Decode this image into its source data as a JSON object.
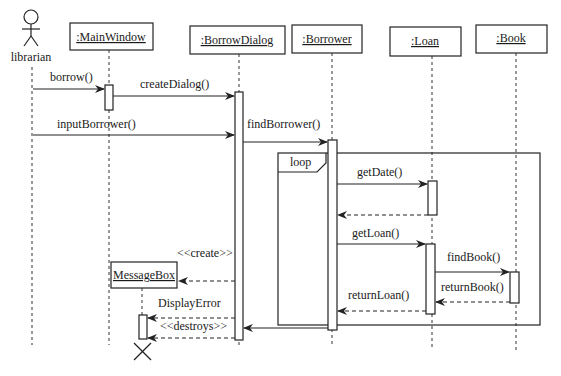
{
  "diagram": {
    "type": "uml-sequence",
    "actor": {
      "name": "librarian"
    },
    "lifelines": [
      {
        "id": "mainwindow",
        "label": ":MainWindow"
      },
      {
        "id": "borrowdialog",
        "label": ":BorrowDialog"
      },
      {
        "id": "borrower",
        "label": ":Borrower"
      },
      {
        "id": "loan",
        "label": ":Loan"
      },
      {
        "id": "book",
        "label": ":Book"
      },
      {
        "id": "messagebox",
        "label": "MessageBox"
      }
    ],
    "fragment": {
      "kind": "loop"
    },
    "messages": [
      {
        "label": "borrow()",
        "from": "librarian",
        "to": "mainwindow",
        "type": "sync"
      },
      {
        "label": "createDialog()",
        "from": "mainwindow",
        "to": "borrowdialog",
        "type": "sync"
      },
      {
        "label": "inputBorrower()",
        "from": "librarian",
        "to": "borrowdialog",
        "type": "sync"
      },
      {
        "label": "findBorrower()",
        "from": "borrowdialog",
        "to": "borrower",
        "type": "sync"
      },
      {
        "label": "getDate()",
        "from": "borrower",
        "to": "loan",
        "type": "sync"
      },
      {
        "label": "",
        "from": "loan",
        "to": "borrower",
        "type": "return"
      },
      {
        "label": "getLoan()",
        "from": "borrower",
        "to": "loan",
        "type": "sync"
      },
      {
        "label": "findBook()",
        "from": "loan",
        "to": "book",
        "type": "sync"
      },
      {
        "label": "returnBook()",
        "from": "book",
        "to": "loan",
        "type": "return"
      },
      {
        "label": "returnLoan()",
        "from": "loan",
        "to": "borrower",
        "type": "return"
      },
      {
        "label": "",
        "from": "borrower",
        "to": "borrowdialog",
        "type": "sync"
      },
      {
        "label": "<<create>>",
        "from": "borrowdialog",
        "to": "messagebox",
        "type": "create"
      },
      {
        "label": "DisplayError",
        "from": "borrowdialog",
        "to": "messagebox",
        "type": "async"
      },
      {
        "label": "<<destroys>>",
        "from": "borrowdialog",
        "to": "messagebox",
        "type": "destroy"
      }
    ]
  }
}
